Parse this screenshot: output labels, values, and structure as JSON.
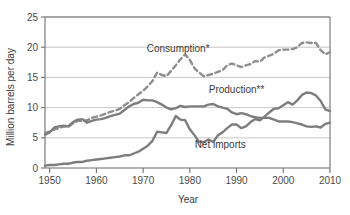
{
  "chart_data": {
    "type": "line",
    "title": "",
    "xlabel": "Year",
    "ylabel": "Million barrels per day",
    "xlim": [
      1949,
      2010
    ],
    "ylim": [
      0,
      25
    ],
    "grid": true,
    "gridlines_y": [
      5,
      10,
      15,
      20,
      25
    ],
    "yticks": [
      0,
      5,
      10,
      15,
      20,
      25
    ],
    "ytick_labels": [
      "0",
      "5",
      "10",
      "15",
      "20",
      "25"
    ],
    "xticks": [
      1950,
      1960,
      1970,
      1980,
      1990,
      2000,
      2010
    ],
    "xtick_labels": [
      "1950",
      "1960",
      "1970",
      "1980",
      "1990",
      "2000",
      "2010"
    ],
    "legend_position": "inline-annotations",
    "colors": {
      "consumption": "#8e8e8e",
      "production": "#7d7d7d",
      "net_imports": "#7d7d7d",
      "gridline": "#b9b9b9",
      "frame": "#6e6e6e",
      "text": "#3a3a3a",
      "background": "#ffffff"
    },
    "series": [
      {
        "name": "Consumption*",
        "label": "Consumption*",
        "style": "dashed",
        "label_x": 1977.5,
        "label_y": 19.2,
        "x": [
          1949,
          1950,
          1951,
          1952,
          1953,
          1954,
          1955,
          1956,
          1957,
          1958,
          1959,
          1960,
          1961,
          1962,
          1963,
          1964,
          1965,
          1966,
          1967,
          1968,
          1969,
          1970,
          1971,
          1972,
          1973,
          1974,
          1975,
          1976,
          1977,
          1978,
          1979,
          1980,
          1981,
          1982,
          1983,
          1984,
          1985,
          1986,
          1987,
          1988,
          1989,
          1990,
          1991,
          1992,
          1993,
          1994,
          1995,
          1996,
          1997,
          1998,
          1999,
          2000,
          2001,
          2002,
          2003,
          2004,
          2005,
          2006,
          2007,
          2008,
          2009,
          2010
        ],
        "values": [
          5.8,
          6.0,
          6.4,
          6.6,
          6.9,
          6.8,
          7.4,
          7.8,
          7.8,
          7.9,
          8.3,
          8.5,
          8.7,
          9.0,
          9.3,
          9.5,
          9.8,
          10.4,
          10.9,
          11.6,
          12.2,
          12.8,
          13.5,
          14.4,
          15.8,
          15.4,
          15.2,
          16.1,
          17.0,
          18.0,
          18.8,
          17.9,
          16.5,
          15.8,
          15.2,
          15.4,
          15.6,
          15.9,
          16.2,
          17.0,
          17.3,
          17.0,
          16.7,
          17.0,
          17.2,
          17.7,
          17.6,
          18.3,
          18.6,
          18.9,
          19.5,
          19.6,
          19.6,
          19.7,
          20.0,
          20.7,
          20.8,
          20.7,
          20.7,
          19.5,
          18.8,
          19.2
        ]
      },
      {
        "name": "Production**",
        "label": "Production**",
        "style": "solid",
        "label_x": 1990.0,
        "label_y": 12.4,
        "x": [
          1949,
          1950,
          1951,
          1952,
          1953,
          1954,
          1955,
          1956,
          1957,
          1958,
          1959,
          1960,
          1961,
          1962,
          1963,
          1964,
          1965,
          1966,
          1967,
          1968,
          1969,
          1970,
          1971,
          1972,
          1973,
          1974,
          1975,
          1976,
          1977,
          1978,
          1979,
          1980,
          1981,
          1982,
          1983,
          1984,
          1985,
          1986,
          1987,
          1988,
          1989,
          1990,
          1991,
          1992,
          1993,
          1994,
          1995,
          1996,
          1997,
          1998,
          1999,
          2000,
          2001,
          2002,
          2003,
          2004,
          2005,
          2006,
          2007,
          2008,
          2009,
          2010
        ],
        "values": [
          5.5,
          5.9,
          6.7,
          6.9,
          7.0,
          6.9,
          7.6,
          8.0,
          8.1,
          7.5,
          7.8,
          8.0,
          8.1,
          8.3,
          8.6,
          8.8,
          9.0,
          9.6,
          10.2,
          10.6,
          10.8,
          11.3,
          11.2,
          11.2,
          10.9,
          10.5,
          10.0,
          9.7,
          9.9,
          10.3,
          10.1,
          10.2,
          10.2,
          10.2,
          10.2,
          10.5,
          10.6,
          10.2,
          10.0,
          9.8,
          9.2,
          8.9,
          9.1,
          8.9,
          8.6,
          8.4,
          8.3,
          8.3,
          8.3,
          8.0,
          7.7,
          7.7,
          7.7,
          7.6,
          7.4,
          7.2,
          6.9,
          6.8,
          6.9,
          6.7,
          7.3,
          7.5
        ]
      },
      {
        "name": "Net imports",
        "label": "Net imports",
        "style": "solid",
        "label_x": 1986.5,
        "label_y": 3.3,
        "x": [
          1949,
          1950,
          1951,
          1952,
          1953,
          1954,
          1955,
          1956,
          1957,
          1958,
          1959,
          1960,
          1961,
          1962,
          1963,
          1964,
          1965,
          1966,
          1967,
          1968,
          1969,
          1970,
          1971,
          1972,
          1973,
          1974,
          1975,
          1976,
          1977,
          1978,
          1979,
          1980,
          1981,
          1982,
          1983,
          1984,
          1985,
          1986,
          1987,
          1988,
          1989,
          1990,
          1991,
          1992,
          1993,
          1994,
          1995,
          1996,
          1997,
          1998,
          1999,
          2000,
          2001,
          2002,
          2003,
          2004,
          2005,
          2006,
          2007,
          2008,
          2009,
          2010
        ],
        "values": [
          0.4,
          0.5,
          0.5,
          0.6,
          0.7,
          0.7,
          0.9,
          1.0,
          1.0,
          1.2,
          1.3,
          1.4,
          1.5,
          1.6,
          1.7,
          1.8,
          1.9,
          2.1,
          2.1,
          2.4,
          2.7,
          3.2,
          3.7,
          4.5,
          6.0,
          5.9,
          5.8,
          7.1,
          8.6,
          8.0,
          7.9,
          6.4,
          5.4,
          4.3,
          4.3,
          4.7,
          4.3,
          5.4,
          5.9,
          6.6,
          7.2,
          7.2,
          6.6,
          6.9,
          7.6,
          8.1,
          7.9,
          8.5,
          9.2,
          9.8,
          9.9,
          10.4,
          10.9,
          10.5,
          11.2,
          12.1,
          12.5,
          12.4,
          12.0,
          11.1,
          9.7,
          9.4
        ]
      }
    ]
  }
}
